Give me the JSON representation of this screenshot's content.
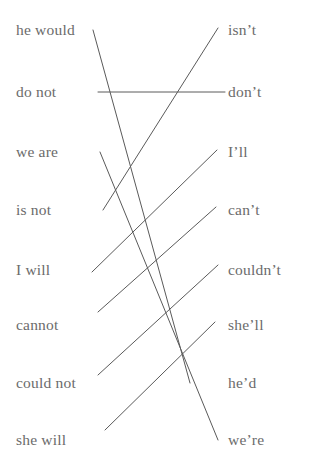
{
  "worksheet": {
    "left_column": {
      "name": "phrases",
      "items": [
        {
          "label": "he would",
          "y": 30
        },
        {
          "label": "do not",
          "y": 92
        },
        {
          "label": "we are",
          "y": 152
        },
        {
          "label": "is not",
          "y": 210
        },
        {
          "label": "I will",
          "y": 270
        },
        {
          "label": "cannot",
          "y": 325
        },
        {
          "label": "could not",
          "y": 383
        },
        {
          "label": "she will",
          "y": 440
        }
      ]
    },
    "right_column": {
      "name": "contractions",
      "items": [
        {
          "label": "isn’t",
          "y": 30
        },
        {
          "label": "don’t",
          "y": 92
        },
        {
          "label": "I’ll",
          "y": 152
        },
        {
          "label": "can’t",
          "y": 210
        },
        {
          "label": "couldn’t",
          "y": 270
        },
        {
          "label": "she’ll",
          "y": 325
        },
        {
          "label": "he’d",
          "y": 383
        },
        {
          "label": "we’re",
          "y": 440
        }
      ]
    },
    "connections": [
      {
        "from": "he would",
        "to": "he’d",
        "x1": 93,
        "y1": 30,
        "x2": 190,
        "y2": 383
      },
      {
        "from": "do not",
        "to": "don’t",
        "x1": 98,
        "y1": 92,
        "x2": 225,
        "y2": 92
      },
      {
        "from": "we are",
        "to": "we’re",
        "x1": 100,
        "y1": 152,
        "x2": 218,
        "y2": 440
      },
      {
        "from": "is not",
        "to": "isn’t",
        "x1": 103,
        "y1": 210,
        "x2": 218,
        "y2": 28
      },
      {
        "from": "I will",
        "to": "I’ll",
        "x1": 92,
        "y1": 272,
        "x2": 217,
        "y2": 150
      },
      {
        "from": "cannot",
        "to": "can’t",
        "x1": 98,
        "y1": 312,
        "x2": 216,
        "y2": 207
      },
      {
        "from": "could not",
        "to": "couldn’t",
        "x1": 98,
        "y1": 375,
        "x2": 218,
        "y2": 265
      },
      {
        "from": "she will",
        "to": "she’ll",
        "x1": 105,
        "y1": 430,
        "x2": 215,
        "y2": 322
      }
    ],
    "style": {
      "line_color": "#5a5a5a",
      "text_color": "#6b6b6b",
      "background": "#ffffff"
    }
  }
}
